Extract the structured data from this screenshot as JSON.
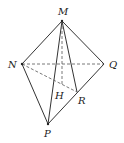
{
  "diagram": {
    "type": "geometry-tetrahedron",
    "points": {
      "M": {
        "x": 62,
        "y": 21,
        "label": "M",
        "lx": 58,
        "ly": 15
      },
      "N": {
        "x": 22,
        "y": 64,
        "label": "N",
        "lx": 8,
        "ly": 68
      },
      "Q": {
        "x": 104,
        "y": 64,
        "label": "Q",
        "lx": 109,
        "ly": 68
      },
      "P": {
        "x": 48,
        "y": 124,
        "label": "P",
        "lx": 44,
        "ly": 137
      },
      "H": {
        "x": 62,
        "y": 86,
        "label": "H",
        "lx": 55,
        "ly": 99
      },
      "R": {
        "x": 77,
        "y": 92,
        "label": "R",
        "lx": 78,
        "ly": 104
      }
    },
    "solid_edges": [
      [
        "M",
        "N"
      ],
      [
        "M",
        "Q"
      ],
      [
        "M",
        "P"
      ],
      [
        "M",
        "R"
      ],
      [
        "N",
        "P"
      ],
      [
        "P",
        "Q"
      ]
    ],
    "dashed_edges": [
      [
        "N",
        "Q"
      ],
      [
        "N",
        "R"
      ],
      [
        "M",
        "H"
      ]
    ],
    "line_color": "#333333"
  }
}
